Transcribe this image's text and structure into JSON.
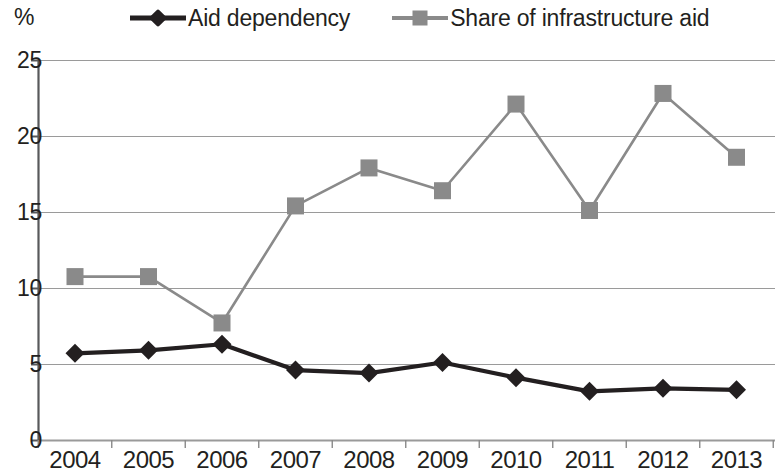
{
  "axis_unit_label": "%",
  "legend": {
    "items": [
      {
        "label": "Aid dependency",
        "marker": "diamond-marker-icon",
        "color": "#231f20"
      },
      {
        "label": "Share of infrastructure aid",
        "marker": "square-marker-icon",
        "color": "#8a8a8a"
      }
    ]
  },
  "chart_data": {
    "type": "line",
    "title": "",
    "xlabel": "",
    "ylabel": "%",
    "categories": [
      "2004",
      "2005",
      "2006",
      "2007",
      "2008",
      "2009",
      "2010",
      "2011",
      "2012",
      "2013"
    ],
    "series": [
      {
        "name": "Aid dependency",
        "color": "#231f20",
        "marker": "diamond",
        "values": [
          5.7,
          5.9,
          6.3,
          4.6,
          4.4,
          5.1,
          4.1,
          3.2,
          3.4,
          3.3
        ]
      },
      {
        "name": "Share of infrastructure aid",
        "color": "#8a8a8a",
        "marker": "square",
        "values": [
          10.75,
          10.75,
          7.7,
          15.4,
          17.9,
          16.4,
          22.1,
          15.1,
          22.8,
          18.6
        ]
      }
    ],
    "ylim": [
      0,
      25
    ],
    "yticks": [
      "0",
      "5",
      "10",
      "15",
      "20",
      "25"
    ],
    "ytick_values": [
      0,
      5,
      10,
      15,
      20,
      25
    ],
    "grid": true,
    "legend_position": "top"
  }
}
